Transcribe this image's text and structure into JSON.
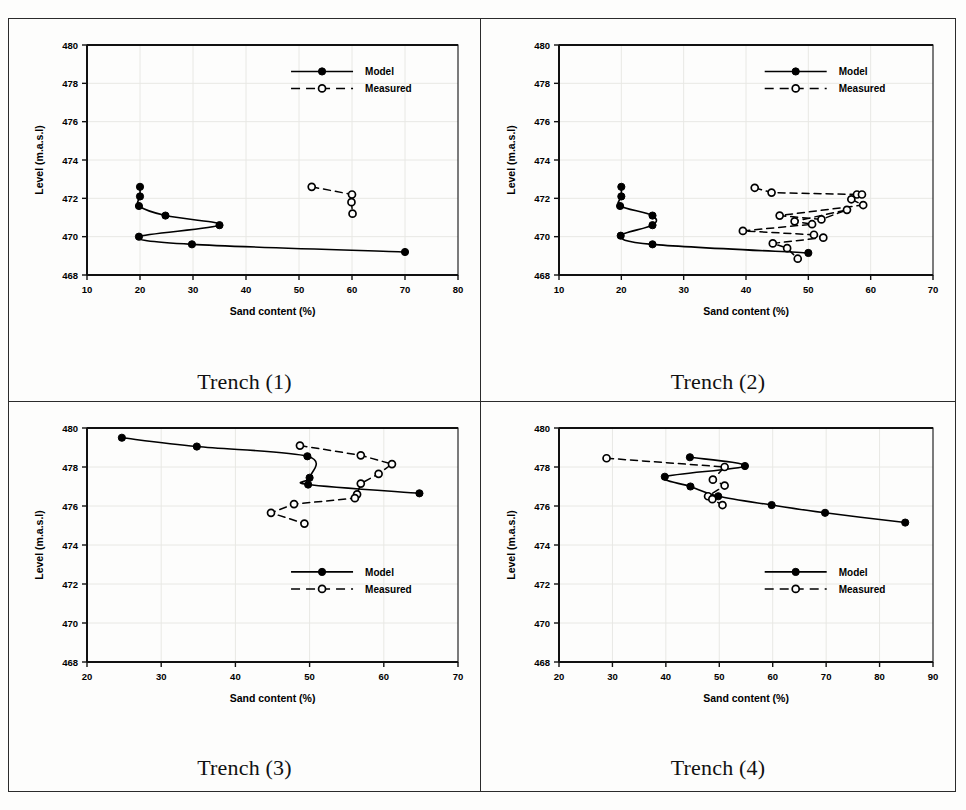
{
  "figure": {
    "panel_count": 4,
    "series_names": [
      "Model",
      "Measured"
    ],
    "colors": {
      "ink": "#000000",
      "frame": "#2b2b2b",
      "grid": "#e8e8e4",
      "paper": "#fdfdfc"
    }
  },
  "legend": {
    "model_label": "Model",
    "measured_label": "Measured",
    "model_marker": "filled-circle",
    "measured_marker": "open-circle",
    "model_line": "solid",
    "measured_line": "dashed"
  },
  "captions": {
    "trench1": "Trench (1)",
    "trench2": "Trench (2)",
    "trench3": "Trench (3)",
    "trench4": "Trench (4)"
  },
  "axis_titles": {
    "x": "Sand content (%)",
    "y": "Level (m.a.s.l)"
  },
  "chart_data": [
    {
      "id": "trench1",
      "type": "scatter",
      "title": "Trench (1)",
      "xlabel": "Sand content (%)",
      "ylabel": "Level (m.a.s.l)",
      "xlim": [
        10,
        80
      ],
      "ylim": [
        468,
        480
      ],
      "xticks": [
        10,
        20,
        30,
        40,
        50,
        60,
        70,
        80
      ],
      "yticks": [
        468,
        470,
        472,
        474,
        476,
        478,
        480
      ],
      "grid": true,
      "legend_position": "top-right",
      "series": [
        {
          "name": "Model",
          "marker": "filled-circle",
          "line": "solid",
          "x": [
            20.0,
            20.0,
            19.8,
            24.8,
            35.0,
            19.8,
            29.8,
            70.0
          ],
          "y": [
            472.6,
            472.1,
            471.6,
            471.1,
            470.6,
            470.0,
            469.6,
            469.2
          ]
        },
        {
          "name": "Measured",
          "marker": "open-circle",
          "line": "dashed",
          "x": [
            52.4,
            60.0,
            59.9,
            60.1
          ],
          "y": [
            472.6,
            472.2,
            471.8,
            471.2
          ]
        }
      ]
    },
    {
      "id": "trench2",
      "type": "scatter",
      "title": "Trench (2)",
      "xlabel": "Sand content (%)",
      "ylabel": "Level (m.a.s.l)",
      "xlim": [
        10,
        70
      ],
      "ylim": [
        468,
        480
      ],
      "xticks": [
        10,
        20,
        30,
        40,
        50,
        60,
        70
      ],
      "yticks": [
        468,
        470,
        472,
        474,
        476,
        478,
        480
      ],
      "grid": true,
      "legend_position": "top-right",
      "series": [
        {
          "name": "Model",
          "marker": "filled-circle",
          "line": "solid",
          "x": [
            20.0,
            20.0,
            19.8,
            25.0,
            25.0,
            19.9,
            25.0,
            50.0
          ],
          "y": [
            472.6,
            472.1,
            471.6,
            471.1,
            470.6,
            470.05,
            469.6,
            469.15
          ]
        },
        {
          "name": "Measured",
          "marker": "open-circle",
          "line": "dashed",
          "x": [
            41.4,
            44.1,
            57.8,
            58.6,
            56.9,
            58.8,
            45.4,
            52.1,
            56.2,
            47.8,
            50.6,
            39.5,
            50.9,
            52.4,
            44.3,
            46.6,
            48.3
          ],
          "y": [
            472.55,
            472.3,
            472.2,
            472.2,
            471.95,
            471.65,
            471.1,
            470.9,
            471.4,
            470.8,
            470.65,
            470.3,
            470.1,
            469.95,
            469.65,
            469.4,
            468.85
          ]
        }
      ]
    },
    {
      "id": "trench3",
      "type": "scatter",
      "title": "Trench (3)",
      "xlabel": "Sand content (%)",
      "ylabel": "Level (m.a.s.l)",
      "xlim": [
        20,
        70
      ],
      "ylim": [
        468,
        480
      ],
      "xticks": [
        20,
        30,
        40,
        50,
        60,
        70
      ],
      "yticks": [
        468,
        470,
        472,
        474,
        476,
        478,
        480
      ],
      "grid": true,
      "legend_position": "center-right",
      "series": [
        {
          "name": "Model",
          "marker": "filled-circle",
          "line": "solid",
          "x": [
            24.7,
            34.8,
            49.7,
            50.0,
            49.8,
            64.8
          ],
          "y": [
            479.5,
            479.05,
            478.55,
            477.45,
            477.1,
            476.65
          ]
        },
        {
          "name": "Measured",
          "marker": "open-circle",
          "line": "dashed",
          "x": [
            48.7,
            56.9,
            61.1,
            59.3,
            56.9,
            56.4,
            56.1,
            47.9,
            44.8,
            49.3
          ],
          "y": [
            479.1,
            478.6,
            478.15,
            477.65,
            477.15,
            476.6,
            476.4,
            476.1,
            475.65,
            475.1
          ]
        }
      ]
    },
    {
      "id": "trench4",
      "type": "scatter",
      "title": "Trench (4)",
      "xlabel": "Sand content (%)",
      "ylabel": "Level (m.a.s.l)",
      "xlim": [
        20,
        90
      ],
      "ylim": [
        468,
        480
      ],
      "xticks": [
        20,
        30,
        40,
        50,
        60,
        70,
        80,
        90
      ],
      "yticks": [
        468,
        470,
        472,
        474,
        476,
        478,
        480
      ],
      "grid": true,
      "legend_position": "center-right",
      "series": [
        {
          "name": "Model",
          "marker": "filled-circle",
          "line": "solid",
          "x": [
            44.5,
            54.8,
            39.8,
            44.6,
            49.8,
            59.8,
            69.8,
            84.8
          ],
          "y": [
            478.5,
            478.05,
            477.5,
            477.0,
            476.5,
            476.05,
            475.65,
            475.15
          ]
        },
        {
          "name": "Measured",
          "marker": "open-circle",
          "line": "dashed",
          "x": [
            28.9,
            51.0,
            48.8,
            51.0,
            47.9,
            48.7,
            50.6
          ],
          "y": [
            478.45,
            478.0,
            477.35,
            477.05,
            476.5,
            476.35,
            476.05
          ]
        }
      ]
    }
  ]
}
